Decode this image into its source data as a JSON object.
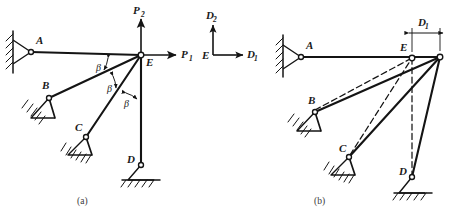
{
  "figure": {
    "background_color": "#ffffff",
    "line_color": "#141414",
    "captions": {
      "panel_a": "(a)",
      "panel_b": "(b)"
    }
  },
  "legend": {
    "origin_label": "E",
    "horizontal_axis_label": "D",
    "horizontal_axis_sub": "1",
    "vertical_axis_label": "D",
    "vertical_axis_sub": "2"
  },
  "panel_a": {
    "caption": "(a)",
    "joint_labels": {
      "a": "A",
      "b": "B",
      "c": "C",
      "d": "D",
      "e": "E"
    },
    "forces": [
      {
        "name": "horizontal-force",
        "label": "P",
        "sub": "1",
        "direction": "right"
      },
      {
        "name": "vertical-force",
        "label": "P",
        "sub": "2",
        "direction": "up"
      }
    ],
    "angles": [
      {
        "label": "β",
        "between": "EA-EB"
      },
      {
        "label": "β",
        "between": "EB-EC"
      },
      {
        "label": "β",
        "between": "EC-ED"
      }
    ],
    "members": [
      "EA",
      "EB",
      "EC",
      "ED"
    ],
    "supports": [
      {
        "joint": "A",
        "type": "wall-pin"
      },
      {
        "joint": "B",
        "type": "pin-hatched"
      },
      {
        "joint": "C",
        "type": "pin-hatched"
      },
      {
        "joint": "D",
        "type": "pin-ground"
      }
    ]
  },
  "panel_b": {
    "caption": "(b)",
    "joint_labels": {
      "a": "A",
      "b": "B",
      "c": "C",
      "d": "D",
      "e": "E"
    },
    "dimension": {
      "label": "D",
      "sub": "1",
      "description": "horizontal displacement of joint E"
    },
    "members": [
      "EA",
      "EB",
      "EC",
      "ED"
    ],
    "ghost_members": [
      "EB-original",
      "EC-original",
      "ED-original"
    ],
    "supports": [
      {
        "joint": "A",
        "type": "wall-pin"
      },
      {
        "joint": "B",
        "type": "pin-hatched"
      },
      {
        "joint": "C",
        "type": "pin-hatched"
      },
      {
        "joint": "D",
        "type": "pin-ground"
      }
    ]
  }
}
